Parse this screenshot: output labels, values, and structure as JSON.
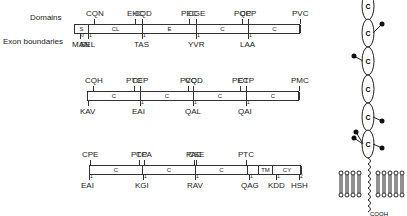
{
  "labels": {
    "domains": "Domains",
    "exons": "Exon boundaries"
  },
  "rows": [
    {
      "y": 24,
      "x0": 74,
      "x1": 300,
      "segs": [
        {
          "x": 74,
          "w": 14,
          "label": "S"
        },
        {
          "x": 88,
          "w": 54,
          "label": "CL"
        },
        {
          "x": 142,
          "w": 54,
          "label": "E"
        },
        {
          "x": 196,
          "w": 52,
          "label": "C"
        },
        {
          "x": 248,
          "w": 52,
          "label": "C"
        }
      ],
      "top": [
        {
          "x": 94,
          "t": "CQN"
        },
        {
          "x": 135,
          "t": "EHC"
        },
        {
          "x": 142,
          "t": "CQD"
        },
        {
          "x": 189,
          "t": "PEC"
        },
        {
          "x": 196,
          "t": "CGE"
        },
        {
          "x": 242,
          "t": "PQC"
        },
        {
          "x": 248,
          "t": "CPP"
        },
        {
          "x": 300,
          "t": "PVC"
        }
      ],
      "bot": [
        {
          "x": 80,
          "t": "MAN",
          "n": "0"
        },
        {
          "x": 88,
          "t": "SEL",
          "n": "1"
        },
        {
          "x": 142,
          "t": "TAS",
          "n": "1"
        },
        {
          "x": 196,
          "t": "YVR",
          "n": "1"
        },
        {
          "x": 248,
          "t": "LAA",
          "n": "1"
        }
      ]
    },
    {
      "y": 91,
      "x0": 87,
      "x1": 299,
      "segs": [
        {
          "x": 87,
          "w": 53,
          "label": "C"
        },
        {
          "x": 140,
          "w": 53,
          "label": "C"
        },
        {
          "x": 193,
          "w": 53,
          "label": "C"
        },
        {
          "x": 246,
          "w": 53,
          "label": "C"
        }
      ],
      "top": [
        {
          "x": 93,
          "t": "CQH"
        },
        {
          "x": 134,
          "t": "PTC"
        },
        {
          "x": 140,
          "t": "CEP"
        },
        {
          "x": 188,
          "t": "PVC"
        },
        {
          "x": 193,
          "t": "CQD"
        },
        {
          "x": 240,
          "t": "PEC"
        },
        {
          "x": 246,
          "t": "CTP"
        },
        {
          "x": 299,
          "t": "PMC"
        }
      ],
      "bot": [
        {
          "x": 88,
          "t": "KAV"
        },
        {
          "x": 140,
          "t": "EAI",
          "n": "1"
        },
        {
          "x": 193,
          "t": "QAL",
          "n": "1"
        },
        {
          "x": 246,
          "t": "QAI",
          "n": "1"
        }
      ]
    },
    {
      "y": 165,
      "x0": 89,
      "x1": 301,
      "segs": [
        {
          "x": 89,
          "w": 53,
          "label": "C"
        },
        {
          "x": 142,
          "w": 53,
          "label": "C"
        },
        {
          "x": 195,
          "w": 52,
          "label": "C"
        },
        {
          "x": 247,
          "w": 11,
          "label": ""
        },
        {
          "x": 258,
          "w": 14,
          "label": "TM"
        },
        {
          "x": 272,
          "w": 29,
          "label": "CY"
        }
      ],
      "top": [
        {
          "x": 90,
          "t": "CPE"
        },
        {
          "x": 139,
          "t": "PTC"
        },
        {
          "x": 144,
          "t": "CPA"
        },
        {
          "x": 194,
          "t": "PAC"
        },
        {
          "x": 196,
          "t": "CSE"
        },
        {
          "x": 246,
          "t": "PTC"
        }
      ],
      "bot": [
        {
          "x": 89,
          "t": "EAI",
          "n": "1"
        },
        {
          "x": 143,
          "t": "KGI",
          "n": "1"
        },
        {
          "x": 195,
          "t": "RAV",
          "n": "1"
        },
        {
          "x": 249,
          "t": "QAG",
          "n": "1"
        },
        {
          "x": 276,
          "t": "KDD",
          "n": "1"
        },
        {
          "x": 299,
          "t": "HSH",
          "n": "2"
        }
      ]
    }
  ],
  "protein": {
    "domain_label": "C",
    "terminus": "COOH"
  }
}
